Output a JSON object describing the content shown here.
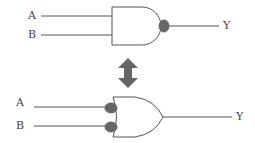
{
  "top_gate": {
    "type": "NAND",
    "input_a": "A",
    "input_b": "B",
    "output": "Y"
  },
  "equivalence_arrow": "double-arrow-icon",
  "bottom_gate": {
    "type": "OR with inverted inputs",
    "input_a": "A",
    "input_b": "B",
    "output": "Y"
  },
  "colors": {
    "line": "#555555",
    "bubble": "#666666",
    "arrow": "#666666",
    "text": "#444444"
  }
}
